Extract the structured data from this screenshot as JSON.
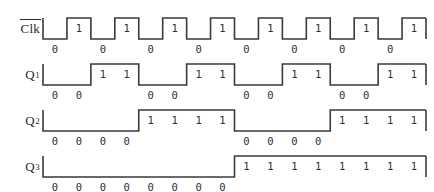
{
  "figure": {
    "type": "digital-timing-diagram",
    "background_color": "#ffffff",
    "line_color": "#3a3a3a",
    "text_color": "#2f2f2f",
    "cycles": 16
  },
  "signals": [
    {
      "id": "clk",
      "label": "Clk",
      "overline": true,
      "subscript": "",
      "period_in_cycles": 1,
      "start_level": 0,
      "bits": [
        0,
        1,
        0,
        1,
        0,
        1,
        0,
        1,
        0,
        1,
        0,
        1,
        0,
        1,
        0,
        1
      ]
    },
    {
      "id": "q1",
      "label": "Q",
      "overline": false,
      "subscript": "1",
      "period_in_cycles": 2,
      "start_level": 0,
      "bits": [
        0,
        0,
        1,
        1,
        0,
        0,
        1,
        1,
        0,
        0,
        1,
        1,
        0,
        0,
        1,
        1
      ]
    },
    {
      "id": "q2",
      "label": "Q",
      "overline": false,
      "subscript": "2",
      "period_in_cycles": 4,
      "start_level": 0,
      "bits": [
        0,
        0,
        0,
        0,
        1,
        1,
        1,
        1,
        0,
        0,
        0,
        0,
        1,
        1,
        1,
        1
      ]
    },
    {
      "id": "q3",
      "label": "Q",
      "overline": false,
      "subscript": "3",
      "period_in_cycles": 8,
      "start_level": 0,
      "bits": [
        0,
        0,
        0,
        0,
        0,
        0,
        0,
        0,
        1,
        1,
        1,
        1,
        1,
        1,
        1,
        1
      ]
    }
  ]
}
